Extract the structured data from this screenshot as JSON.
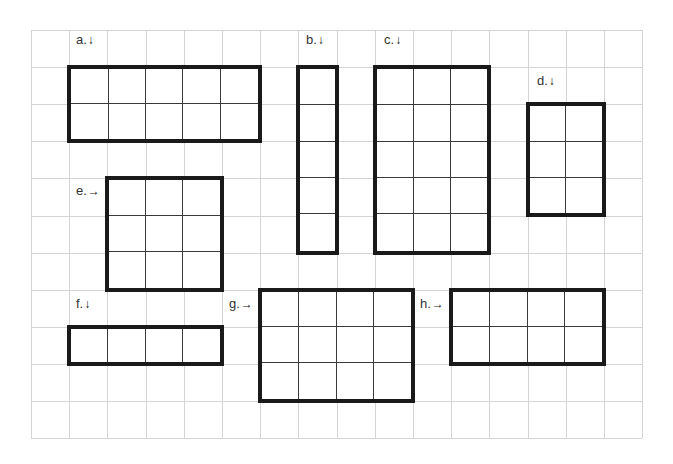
{
  "grid": {
    "origin_x": 31,
    "origin_y": 30,
    "cell_w": 38.2,
    "cell_h": 37.1,
    "cols": 16,
    "rows": 11,
    "line_color": "#d4d4d4"
  },
  "arrays": [
    {
      "id": "a",
      "label": "a.",
      "arrow": "↓",
      "arrow_name": "down-arrow-icon",
      "col": 1,
      "row": 1,
      "width_cells": 5,
      "height_cells": 2,
      "label_x": 76,
      "label_y": 33
    },
    {
      "id": "b",
      "label": "b.",
      "arrow": "↓",
      "arrow_name": "down-arrow-icon",
      "col": 7,
      "row": 1,
      "width_cells": 1,
      "height_cells": 5,
      "label_x": 306,
      "label_y": 33
    },
    {
      "id": "c",
      "label": "c.",
      "arrow": "↓",
      "arrow_name": "down-arrow-icon",
      "col": 9,
      "row": 1,
      "width_cells": 3,
      "height_cells": 5,
      "label_x": 384,
      "label_y": 33
    },
    {
      "id": "d",
      "label": "d.",
      "arrow": "↓",
      "arrow_name": "down-arrow-icon",
      "col": 13,
      "row": 2,
      "width_cells": 2,
      "height_cells": 3,
      "label_x": 537,
      "label_y": 74
    },
    {
      "id": "e",
      "label": "e.",
      "arrow": "→",
      "arrow_name": "right-arrow-icon",
      "col": 2,
      "row": 4,
      "width_cells": 3,
      "height_cells": 3,
      "label_x": 76,
      "label_y": 184
    },
    {
      "id": "f",
      "label": "f.",
      "arrow": "↓",
      "arrow_name": "down-arrow-icon",
      "col": 1,
      "row": 8,
      "width_cells": 4,
      "height_cells": 1,
      "label_x": 76,
      "label_y": 297
    },
    {
      "id": "g",
      "label": "g.",
      "arrow": "→",
      "arrow_name": "right-arrow-icon",
      "col": 6,
      "row": 7,
      "width_cells": 4,
      "height_cells": 3,
      "label_x": 229,
      "label_y": 297
    },
    {
      "id": "h",
      "label": "h.",
      "arrow": "→",
      "arrow_name": "right-arrow-icon",
      "col": 11,
      "row": 7,
      "width_cells": 4,
      "height_cells": 2,
      "label_x": 420,
      "label_y": 297
    }
  ]
}
